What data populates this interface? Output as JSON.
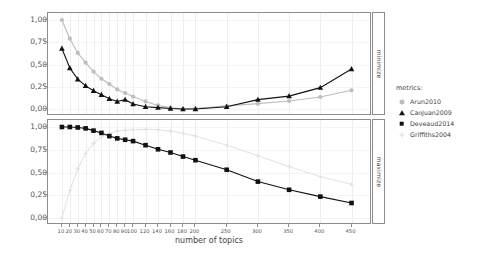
{
  "chart_data": {
    "type": "line",
    "title": "",
    "xlabel": "number of topics",
    "ylabel": "",
    "xlim": [
      0,
      470
    ],
    "ylim": [
      0,
      1
    ],
    "grid": true,
    "legend_position": "right",
    "legend_title": "metrics:",
    "x": [
      10,
      20,
      30,
      40,
      50,
      60,
      70,
      80,
      90,
      100,
      120,
      140,
      160,
      180,
      200,
      250,
      300,
      350,
      400,
      450
    ],
    "panels": [
      {
        "strip_label": "minimize",
        "ytick_labels": [
          "0,00",
          "0,25",
          "0,50",
          "0,75",
          "1,00"
        ],
        "ytick_values": [
          0,
          0.25,
          0.5,
          0.75,
          1
        ],
        "series": [
          {
            "name": "Arun2010",
            "marker": "circle",
            "color": "#bdbdbd",
            "values": [
              1.0,
              0.79,
              0.63,
              0.52,
              0.42,
              0.34,
              0.28,
              0.22,
              0.18,
              0.14,
              0.085,
              0.04,
              0.015,
              0.0,
              0.005,
              0.035,
              0.06,
              0.09,
              0.135,
              0.21
            ]
          },
          {
            "name": "CaoJuan2009",
            "marker": "triangle",
            "color": "#111111",
            "values": [
              0.68,
              0.46,
              0.335,
              0.26,
              0.205,
              0.16,
              0.115,
              0.085,
              0.105,
              0.055,
              0.025,
              0.015,
              0.005,
              0.0,
              0.0,
              0.025,
              0.105,
              0.145,
              0.24,
              0.45
            ]
          }
        ]
      },
      {
        "strip_label": "maximize",
        "ytick_labels": [
          "0,00",
          "0,25",
          "0,50",
          "0,75",
          "1,00"
        ],
        "ytick_values": [
          0,
          0.25,
          0.5,
          0.75,
          1
        ],
        "series": [
          {
            "name": "Deveaud2014",
            "marker": "square",
            "color": "#111111",
            "values": [
              1.0,
              1.0,
              0.995,
              0.985,
              0.96,
              0.935,
              0.9,
              0.875,
              0.86,
              0.845,
              0.8,
              0.755,
              0.72,
              0.675,
              0.635,
              0.53,
              0.4,
              0.31,
              0.235,
              0.165
            ]
          },
          {
            "name": "Griffiths2004",
            "marker": "plus",
            "color": "#e2e2e2",
            "values": [
              0.0,
              0.3,
              0.54,
              0.71,
              0.82,
              0.89,
              0.93,
              0.955,
              0.965,
              0.97,
              0.975,
              0.97,
              0.955,
              0.93,
              0.9,
              0.8,
              0.685,
              0.565,
              0.455,
              0.37
            ]
          }
        ]
      }
    ],
    "xtick_labels": [
      "10",
      "20",
      "30",
      "40",
      "50",
      "60",
      "70",
      "80",
      "90",
      "100",
      "120",
      "140",
      "160",
      "180",
      "200",
      "250",
      "300",
      "350",
      "400",
      "450"
    ],
    "legend_entries": [
      {
        "label": "Arun2010",
        "marker": "circle",
        "color": "#bdbdbd"
      },
      {
        "label": "CaoJuan2009",
        "marker": "triangle",
        "color": "#111111"
      },
      {
        "label": "Deveaud2014",
        "marker": "square",
        "color": "#111111"
      },
      {
        "label": "Griffiths2004",
        "marker": "plus",
        "color": "#dcdcdc"
      }
    ]
  }
}
